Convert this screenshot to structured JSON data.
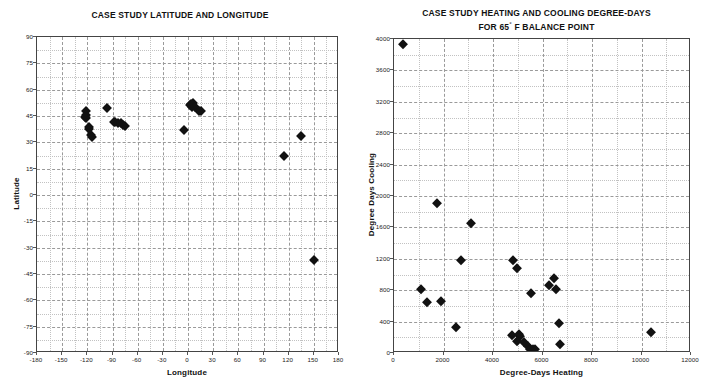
{
  "figure": {
    "background_color": "#ffffff",
    "marker_color": "#111111",
    "grid_major_color": "#9a9a9a",
    "grid_minor_color": "#c2c2c2",
    "axis_color": "#444444"
  },
  "left": {
    "title": "CASE STUDY LATITUDE AND LONGITUDE",
    "xlabel": "Longitude",
    "ylabel": "Latitude",
    "xticks": [
      "-180",
      "-150",
      "-120",
      "-90",
      "-60",
      "-30",
      "0",
      "30",
      "60",
      "90",
      "120",
      "150",
      "180"
    ],
    "yticks": [
      "90",
      "75",
      "60",
      "45",
      "30",
      "15",
      "0",
      "-15",
      "-30",
      "-45",
      "-60",
      "-75",
      "-90"
    ]
  },
  "right": {
    "title_line1": "CASE STUDY HEATING AND COOLING DEGREE-DAYS",
    "title_line2_pre": "FOR 65",
    "title_line2_deg": "°",
    "title_line2_post": " F BALANCE POINT",
    "xlabel": "Degree-Days Heating",
    "ylabel": "Degree Days Cooling",
    "xticks": [
      "0",
      "2000",
      "4000",
      "6000",
      "8000",
      "10000",
      "12000"
    ],
    "yticks": [
      "0",
      "400",
      "800",
      "1200",
      "1600",
      "2000",
      "2400",
      "2800",
      "3200",
      "3600",
      "4000"
    ]
  },
  "chart_data": [
    {
      "type": "scatter",
      "id": "latitude-longitude",
      "title": "CASE STUDY LATITUDE AND LONGITUDE",
      "xlabel": "Longitude",
      "ylabel": "Latitude",
      "xlim": [
        -180,
        180
      ],
      "ylim": [
        -90,
        90
      ],
      "xticks": [
        -180,
        -150,
        -120,
        -90,
        -60,
        -30,
        0,
        30,
        60,
        90,
        120,
        150,
        180
      ],
      "yticks": [
        90,
        75,
        60,
        45,
        30,
        15,
        0,
        -15,
        -30,
        -45,
        -60,
        -75,
        -90
      ],
      "grid": true,
      "minor_grid": true,
      "legend": "none",
      "marker": "filled-diamond",
      "points": [
        {
          "x": -122,
          "y": 47.6
        },
        {
          "x": -122,
          "y": 45.5
        },
        {
          "x": -122,
          "y": 44.0
        },
        {
          "x": -123,
          "y": 44.5
        },
        {
          "x": -118,
          "y": 38.5
        },
        {
          "x": -118,
          "y": 37.5
        },
        {
          "x": -116,
          "y": 34.0
        },
        {
          "x": -115,
          "y": 33.0
        },
        {
          "x": -97,
          "y": 49.5
        },
        {
          "x": -88,
          "y": 41.8
        },
        {
          "x": -87,
          "y": 41.8
        },
        {
          "x": -84,
          "y": 41.0
        },
        {
          "x": -80,
          "y": 41.0
        },
        {
          "x": -77,
          "y": 40.0
        },
        {
          "x": -75,
          "y": 39.5
        },
        {
          "x": -5,
          "y": 37.0
        },
        {
          "x": 2,
          "y": 51.5
        },
        {
          "x": 4,
          "y": 52.0
        },
        {
          "x": 5,
          "y": 50.0
        },
        {
          "x": 6,
          "y": 52.5
        },
        {
          "x": 8,
          "y": 50.0
        },
        {
          "x": 13,
          "y": 48.0
        },
        {
          "x": 15,
          "y": 48.0
        },
        {
          "x": 114,
          "y": 22.0
        },
        {
          "x": 135,
          "y": 33.5
        },
        {
          "x": 150,
          "y": -37.0
        }
      ]
    },
    {
      "type": "scatter",
      "id": "heating-cooling-degree-days",
      "title": "CASE STUDY HEATING AND COOLING DEGREE-DAYS FOR 65° F BALANCE POINT",
      "xlabel": "Degree-Days Heating",
      "ylabel": "Degree Days Cooling",
      "xlim": [
        0,
        12000
      ],
      "ylim": [
        0,
        4000
      ],
      "xticks": [
        0,
        2000,
        4000,
        6000,
        8000,
        10000,
        12000
      ],
      "yticks": [
        0,
        400,
        800,
        1200,
        1600,
        2000,
        2400,
        2800,
        3200,
        3600,
        4000
      ],
      "grid": true,
      "minor_grid": true,
      "legend": "none",
      "marker": "filled-diamond",
      "points": [
        {
          "x": 350,
          "y": 3940
        },
        {
          "x": 1750,
          "y": 1910
        },
        {
          "x": 3100,
          "y": 1660
        },
        {
          "x": 2700,
          "y": 1190
        },
        {
          "x": 4800,
          "y": 1190
        },
        {
          "x": 4950,
          "y": 1080
        },
        {
          "x": 6450,
          "y": 960
        },
        {
          "x": 6250,
          "y": 860
        },
        {
          "x": 6550,
          "y": 820
        },
        {
          "x": 1080,
          "y": 810
        },
        {
          "x": 5550,
          "y": 770
        },
        {
          "x": 1350,
          "y": 650
        },
        {
          "x": 1900,
          "y": 660
        },
        {
          "x": 6650,
          "y": 380
        },
        {
          "x": 2500,
          "y": 330
        },
        {
          "x": 10400,
          "y": 270
        },
        {
          "x": 4750,
          "y": 230
        },
        {
          "x": 5050,
          "y": 245
        },
        {
          "x": 5100,
          "y": 215
        },
        {
          "x": 4950,
          "y": 155
        },
        {
          "x": 5250,
          "y": 140
        },
        {
          "x": 5400,
          "y": 90
        },
        {
          "x": 5500,
          "y": 55
        },
        {
          "x": 5600,
          "y": 45
        },
        {
          "x": 5700,
          "y": 50
        },
        {
          "x": 6700,
          "y": 110
        }
      ]
    }
  ]
}
